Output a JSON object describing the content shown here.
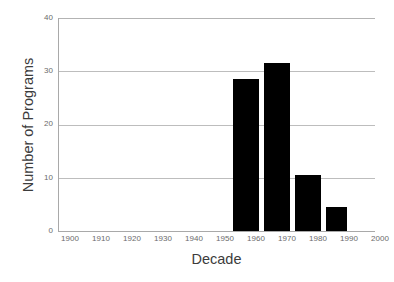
{
  "chart_data": {
    "type": "bar",
    "title": "",
    "xlabel": "Decade",
    "ylabel": "Number of Programs",
    "categories": [
      "1900",
      "1910",
      "1920",
      "1930",
      "1940",
      "1950",
      "1960",
      "1970",
      "1980",
      "1990",
      "2000"
    ],
    "values": [
      0,
      0,
      0,
      0,
      0,
      0,
      28.5,
      31.5,
      10.5,
      4.5,
      0
    ],
    "xtick_labels": [
      "1900",
      "1910",
      "1920",
      "1930",
      "1940",
      "1950",
      "1960",
      "1970",
      "1980",
      "1990",
      "2000"
    ],
    "ytick_labels": [
      "0",
      "10",
      "20",
      "30",
      "40"
    ],
    "ytick_values": [
      0,
      10,
      20,
      30,
      40
    ],
    "ylim": [
      0,
      40
    ],
    "xlim": [
      1900,
      2005
    ],
    "grid": "horizontal",
    "legend": "none",
    "bar_color": "#000000",
    "grid_color": "#bdbdbd",
    "axis_color": "#a9a9a9",
    "bars": [
      {
        "decade": "1960",
        "value": 28.5
      },
      {
        "decade": "1970",
        "value": 31.5
      },
      {
        "decade": "1980",
        "value": 10.5
      },
      {
        "decade": "1990",
        "value": 4.5
      }
    ]
  }
}
